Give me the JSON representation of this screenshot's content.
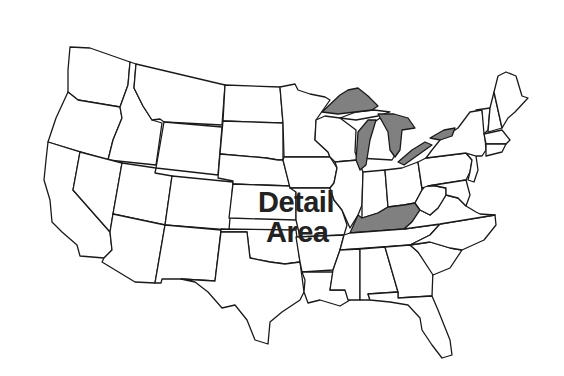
{
  "map": {
    "title": "United States",
    "label": {
      "line1": "Detail",
      "line2": "Area"
    },
    "colors": {
      "background": "#ffffff",
      "border": "#1a1a1a",
      "water": "#808080",
      "highlight": "#808080"
    },
    "highlighted_features": [
      "Kentucky",
      "Great Lakes"
    ],
    "lakes": [
      "Lake Superior",
      "Lake Michigan",
      "Lake Huron",
      "Lake Erie",
      "Lake Ontario"
    ]
  }
}
